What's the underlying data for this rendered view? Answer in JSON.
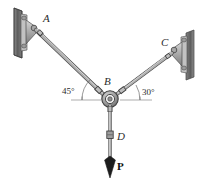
{
  "figure": {
    "type": "statics-free-body-diagram",
    "background_color": "#ffffff",
    "labels": {
      "point_a": "A",
      "point_b": "B",
      "point_c": "C",
      "point_d": "D",
      "force_p": "P"
    },
    "angles": {
      "left": "45°",
      "right": "30°"
    },
    "colors": {
      "wall": "#6e6e6e",
      "wall_edge": "#3f3f3f",
      "bracket": "#b9b9b9",
      "bracket_edge": "#4a4a4a",
      "cable": "#a8a8a8",
      "cable_edge": "#4d4d4d",
      "ring": "#9a9a9a",
      "label": "#2b2b2b",
      "force_label": "#111111",
      "reference_line": "#7a7a7a"
    },
    "geometry": {
      "point_a": [
        34,
        26
      ],
      "point_b": [
        110,
        99
      ],
      "point_c": [
        178,
        51
      ],
      "point_d": [
        110,
        137
      ],
      "arrow_tip": [
        110,
        175
      ]
    }
  }
}
